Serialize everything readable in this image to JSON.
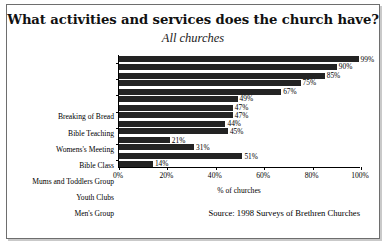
{
  "chart_data": {
    "type": "bar",
    "orientation": "horizontal",
    "title": "What activities and services does the church have?",
    "subtitle": "All churches",
    "xlabel": "% of churches",
    "ylabel": "",
    "xlim": [
      0,
      100
    ],
    "xticks": [
      "0%",
      "20%",
      "40%",
      "60%",
      "80%",
      "100%"
    ],
    "xtick_values": [
      0,
      20,
      40,
      60,
      80,
      100
    ],
    "grid": false,
    "legend": null,
    "bar_color": "#232323",
    "categories": [
      "Breaking of Bread",
      "Bible Teaching",
      "Womens's Meeting",
      "Bible Class",
      "Mums and Toddlers Group",
      "Youth Clubs",
      "Men's Group"
    ],
    "series": [
      {
        "name": "first",
        "values": [
          99,
          85,
          67,
          47,
          44,
          21,
          51
        ],
        "labels": [
          "99%",
          "85%",
          "67%",
          "47%",
          "44%",
          "21%",
          "51%"
        ]
      },
      {
        "name": "second",
        "values": [
          90,
          75,
          49,
          47,
          45,
          31,
          14
        ],
        "labels": [
          "90%",
          "75%",
          "49%",
          "47%",
          "45%",
          "31%",
          "14%"
        ]
      }
    ],
    "bars": [
      {
        "category": "Breaking of Bread",
        "value": 99,
        "label": "99%"
      },
      {
        "category": "Breaking of Bread",
        "value": 90,
        "label": "90%"
      },
      {
        "category": "Bible Teaching",
        "value": 85,
        "label": "85%"
      },
      {
        "category": "Bible Teaching",
        "value": 75,
        "label": "75%"
      },
      {
        "category": "Womens's Meeting",
        "value": 67,
        "label": "67%"
      },
      {
        "category": "Womens's Meeting",
        "value": 49,
        "label": "49%"
      },
      {
        "category": "Bible Class",
        "value": 47,
        "label": "47%"
      },
      {
        "category": "Bible Class",
        "value": 47,
        "label": "47%"
      },
      {
        "category": "Mums and Toddlers Group",
        "value": 45,
        "label": "45%"
      },
      {
        "category": "Mums and Toddlers Group",
        "value": 44,
        "label": "44%"
      },
      {
        "category": "Youth Clubs",
        "value": 31,
        "label": "31%"
      },
      {
        "category": "Youth Clubs",
        "value": 21,
        "label": "21%"
      },
      {
        "category": "Men's Group",
        "value": 14,
        "label": "14%"
      },
      {
        "category": "Men's Group",
        "value": 51,
        "label": "51%"
      }
    ],
    "source": "Source: 1998 Surveys of Brethren Churches"
  }
}
